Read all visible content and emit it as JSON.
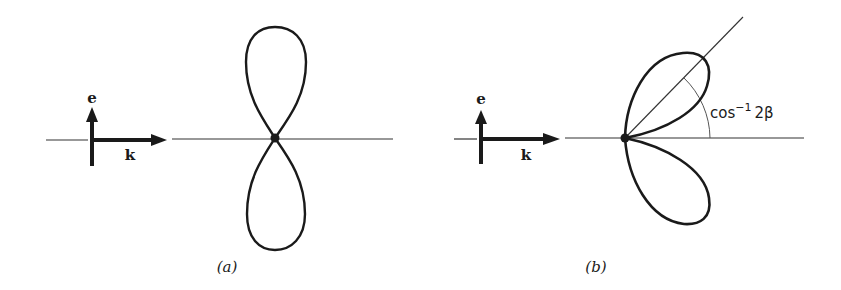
{
  "figure": {
    "panels": [
      {
        "id": "a",
        "caption": "(a)",
        "polarization_label": "e",
        "wavevector_label": "k",
        "pattern": "dipole figure-eight, lobes along e (vertical)"
      },
      {
        "id": "b",
        "caption": "(b)",
        "polarization_label": "e",
        "wavevector_label": "k",
        "pattern": "two lobes tilted forward along k",
        "angle_label": "cos",
        "angle_label_sup": "−1",
        "angle_label_arg": "2β"
      }
    ],
    "colors": {
      "stroke": "#1a1a1a",
      "thin_line": "#333333",
      "background": "#ffffff"
    }
  }
}
